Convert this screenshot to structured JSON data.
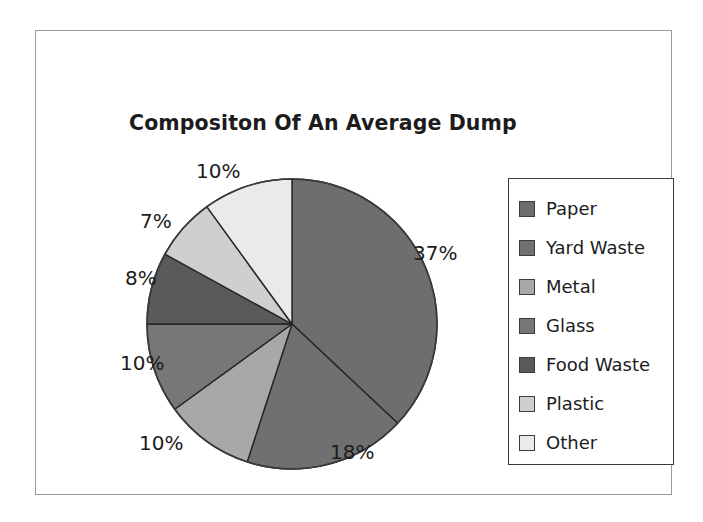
{
  "frame": {
    "border_color": "#9a9a9a"
  },
  "title": "Compositon Of An Average Dump",
  "legend": {
    "items": [
      {
        "label": "Paper",
        "color": "#6e6e6e"
      },
      {
        "label": "Yard Waste",
        "color": "#707070"
      },
      {
        "label": "Metal",
        "color": "#a8a8a8"
      },
      {
        "label": "Glass",
        "color": "#777777"
      },
      {
        "label": "Food Waste",
        "color": "#5a5a5a"
      },
      {
        "label": "Plastic",
        "color": "#cfcfcf"
      },
      {
        "label": "Other",
        "color": "#eaeaea"
      }
    ]
  },
  "labels": {
    "paper": "37%",
    "yard_waste": "18%",
    "metal": "10%",
    "glass": "10%",
    "food_waste": "8%",
    "plastic": "7%",
    "other": "10%"
  },
  "chart_data": {
    "type": "pie",
    "title": "Compositon Of An Average Dump",
    "categories": [
      "Paper",
      "Yard Waste",
      "Metal",
      "Glass",
      "Food Waste",
      "Plastic",
      "Other"
    ],
    "values": [
      37,
      18,
      10,
      10,
      8,
      7,
      10
    ],
    "value_labels": [
      "37%",
      "18%",
      "10%",
      "10%",
      "8%",
      "7%",
      "10%"
    ],
    "unit": "percent",
    "total": 100,
    "colors": [
      "#6e6e6e",
      "#707070",
      "#a8a8a8",
      "#777777",
      "#5a5a5a",
      "#cfcfcf",
      "#eaeaea"
    ],
    "slice_outline_color": "#262626",
    "start_angle_deg": 0,
    "direction": "clockwise",
    "legend_position": "right",
    "grid": false,
    "xlabel": "",
    "ylabel": ""
  }
}
